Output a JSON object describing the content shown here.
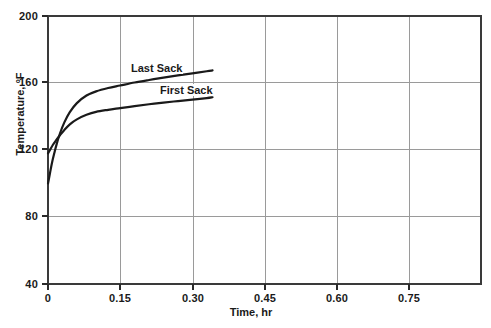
{
  "chart_data": {
    "type": "line",
    "title": "",
    "xlabel": "Time, hr",
    "ylabel": "Temperature, °F",
    "xlim": [
      0,
      0.9
    ],
    "ylim": [
      40,
      200
    ],
    "xticks": [
      "0",
      "0.15",
      "0.30",
      "0.45",
      "0.60",
      "0.75"
    ],
    "xtick_values": [
      0,
      0.15,
      0.3,
      0.45,
      0.6,
      0.75
    ],
    "yticks": [
      "40",
      "80",
      "120",
      "160",
      "200"
    ],
    "ytick_values": [
      40,
      80,
      120,
      160,
      200
    ],
    "grid": true,
    "legend_position": "inline-annotation",
    "series": [
      {
        "name": "Last Sack",
        "label": "Last Sack",
        "color": "#1a1a1a",
        "x": [
          0.0,
          0.004,
          0.008,
          0.013,
          0.018,
          0.025,
          0.034,
          0.045,
          0.06,
          0.08,
          0.1,
          0.125,
          0.15,
          0.18,
          0.21,
          0.24,
          0.27,
          0.3,
          0.33,
          0.342
        ],
        "y": [
          100.0,
          106.0,
          112.0,
          118.0,
          123.5,
          130.0,
          136.5,
          142.5,
          148.0,
          152.5,
          155.0,
          157.0,
          158.5,
          160.3,
          161.8,
          163.2,
          164.5,
          165.7,
          167.0,
          167.5
        ]
      },
      {
        "name": "First Sack",
        "label": "First Sack",
        "color": "#1a1a1a",
        "x": [
          0.0,
          0.005,
          0.01,
          0.016,
          0.024,
          0.034,
          0.046,
          0.06,
          0.08,
          0.1,
          0.125,
          0.15,
          0.18,
          0.21,
          0.24,
          0.27,
          0.3,
          0.33,
          0.342
        ],
        "y": [
          118.0,
          120.5,
          123.0,
          125.5,
          128.5,
          132.0,
          135.5,
          138.3,
          141.0,
          142.8,
          144.0,
          145.0,
          146.2,
          147.3,
          148.3,
          149.2,
          150.1,
          151.0,
          151.5
        ]
      }
    ]
  },
  "axis": {
    "x_title": "Time, hr",
    "y_title": "Temperature, °F",
    "x_tick_labels": [
      "0",
      "0.15",
      "0.30",
      "0.45",
      "0.60",
      "0.75"
    ],
    "y_tick_labels": [
      "200",
      "160",
      "120",
      "80",
      "40"
    ]
  },
  "annotations": {
    "last_sack": "Last Sack",
    "first_sack": "First Sack"
  },
  "colors": {
    "curve": "#1a1a1a",
    "frame": "#3a3a3a",
    "grid": "#9a9a9a",
    "background": "#ffffff"
  }
}
